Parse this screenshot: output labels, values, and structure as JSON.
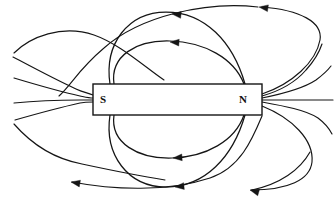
{
  "figure": {
    "background_color": "#ffffff",
    "line_color": "#151515",
    "width": 335,
    "height": 201
  },
  "magnet": {
    "name": "bar-magnet",
    "x": 93,
    "y": 84,
    "width": 169,
    "height": 31,
    "fill": "#ffffff",
    "stroke": "#151515",
    "south_pole_label": "S",
    "north_pole_label": "N",
    "south_label_x": 103,
    "south_label_y": 100,
    "north_label_x": 243,
    "north_label_y": 100
  },
  "field_lines": [
    {
      "name": "inner-loop-top-1",
      "path": "M 110 84 C 104 44 128 12 166 12 C 205 12 233 42 245 84",
      "arrow": {
        "x": 172,
        "y": 14,
        "angle": 186
      }
    },
    {
      "name": "inner-loop-top-2",
      "path": "M 114 84 C 110 56 136 40 170 41 C 204 42 234 58 244 84",
      "arrow": {
        "x": 170,
        "y": 42,
        "angle": 184
      }
    },
    {
      "name": "inner-loop-bottom-1",
      "path": "M 114 115 C 110 143 138 159 172 158 C 206 157 235 141 244 115",
      "arrow": {
        "x": 173,
        "y": 158,
        "angle": 176
      }
    },
    {
      "name": "inner-loop-bottom-2",
      "path": "M 110 115 C 104 155 128 187 166 187 C 205 187 233 157 245 115",
      "arrow": {
        "x": 175,
        "y": 187,
        "angle": 174
      }
    },
    {
      "name": "outer-loop-top-far",
      "path": "M 258 7 C 206 1 140 16 104 48 C 78 70 72 84 59 96",
      "arrow": {
        "x": 259,
        "y": 7,
        "angle": 188
      }
    },
    {
      "name": "outer-loop-top-near-left",
      "path": "M 14 53 C 30 37 62 24 94 35 C 120 44 146 68 164 80",
      "arrow": null
    },
    {
      "name": "outer-line-left-upper",
      "path": "M 13 57 C 30 66 56 80 76 89 C 82 92 88 93 93 95",
      "arrow": null
    },
    {
      "name": "outer-line-left-mid-upper",
      "path": "M 14 78 C 34 84 62 92 80 96 C 85 97 89 98 93 98",
      "arrow": null
    },
    {
      "name": "outer-line-left-mid-lower",
      "path": "M 14 103 C 34 101 62 100 80 100 C 85 100 89 100 93 100",
      "arrow": null
    },
    {
      "name": "outer-line-left-lower",
      "path": "M 15 120 C 36 114 62 107 80 103 C 85 102 89 102 93 102",
      "arrow": null
    },
    {
      "name": "outer-loop-bottom-near-left",
      "path": "M 14 124 C 28 140 50 158 82 164 C 110 170 140 176 165 180",
      "arrow": null
    },
    {
      "name": "outer-loop-bottom-far",
      "path": "M 72 182 C 114 190 168 192 210 178 C 240 168 252 140 262 116",
      "arrow": {
        "x": 71,
        "y": 182,
        "angle": 190
      }
    },
    {
      "name": "outer-line-right-upper",
      "path": "M 262 96 C 276 92 294 84 306 70 C 316 59 320 50 322 44",
      "arrow": null
    },
    {
      "name": "outer-line-right-mid-upper",
      "path": "M 262 98 C 282 94 304 88 316 80 C 324 74 328 70 331 66",
      "arrow": null
    },
    {
      "name": "outer-line-right-mid-lower",
      "path": "M 262 100 C 286 100 308 100 320 100 C 326 100 330 100 333 100",
      "arrow": null
    },
    {
      "name": "outer-line-right-lower",
      "path": "M 262 102 C 284 106 306 110 318 118 C 326 124 330 130 332 134",
      "arrow": null
    },
    {
      "name": "outer-loop-right-top-sweep",
      "path": "M 262 94 C 292 84 316 62 320 40 C 323 22 300 10 262 7",
      "arrow": null
    },
    {
      "name": "outer-loop-right-bottom-sweep",
      "path": "M 262 106 C 292 118 314 140 312 162 C 310 180 288 190 251 190",
      "arrow": null
    },
    {
      "name": "outer-loop-bottom-right-arrowed",
      "path": "M 310 152 C 300 170 280 184 252 190",
      "arrow": {
        "x": 250,
        "y": 190,
        "angle": 196
      }
    }
  ],
  "labels": {
    "south": "S",
    "north": "N"
  }
}
